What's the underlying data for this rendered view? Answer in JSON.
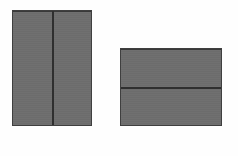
{
  "scene": {
    "title": "Two divided gray panels",
    "background_color": "#fefefe",
    "width": 238,
    "height": 156
  },
  "style": {
    "fill_color": "#6e6e6e",
    "border_color": "#3f3f3f",
    "top_rule_color": "#3a3a3a",
    "divider_color": "#2f2f2f"
  },
  "panels": [
    {
      "name": "portrait-panel",
      "orientation": "portrait",
      "x": 12,
      "y": 10,
      "width": 80,
      "height": 116,
      "fill": "#6e6e6e",
      "divider": {
        "orientation": "vertical",
        "offset": 39,
        "color": "#2f2f2f",
        "thickness": 2
      },
      "cells": [
        {
          "name": "left-cell",
          "label": ""
        },
        {
          "name": "right-cell",
          "label": ""
        }
      ]
    },
    {
      "name": "landscape-panel",
      "orientation": "landscape",
      "x": 120,
      "y": 48,
      "width": 102,
      "height": 78,
      "fill": "#6e6e6e",
      "divider": {
        "orientation": "horizontal",
        "offset": 38,
        "color": "#2f2f2f",
        "thickness": 2
      },
      "cells": [
        {
          "name": "top-cell",
          "label": ""
        },
        {
          "name": "bottom-cell",
          "label": ""
        }
      ]
    }
  ]
}
